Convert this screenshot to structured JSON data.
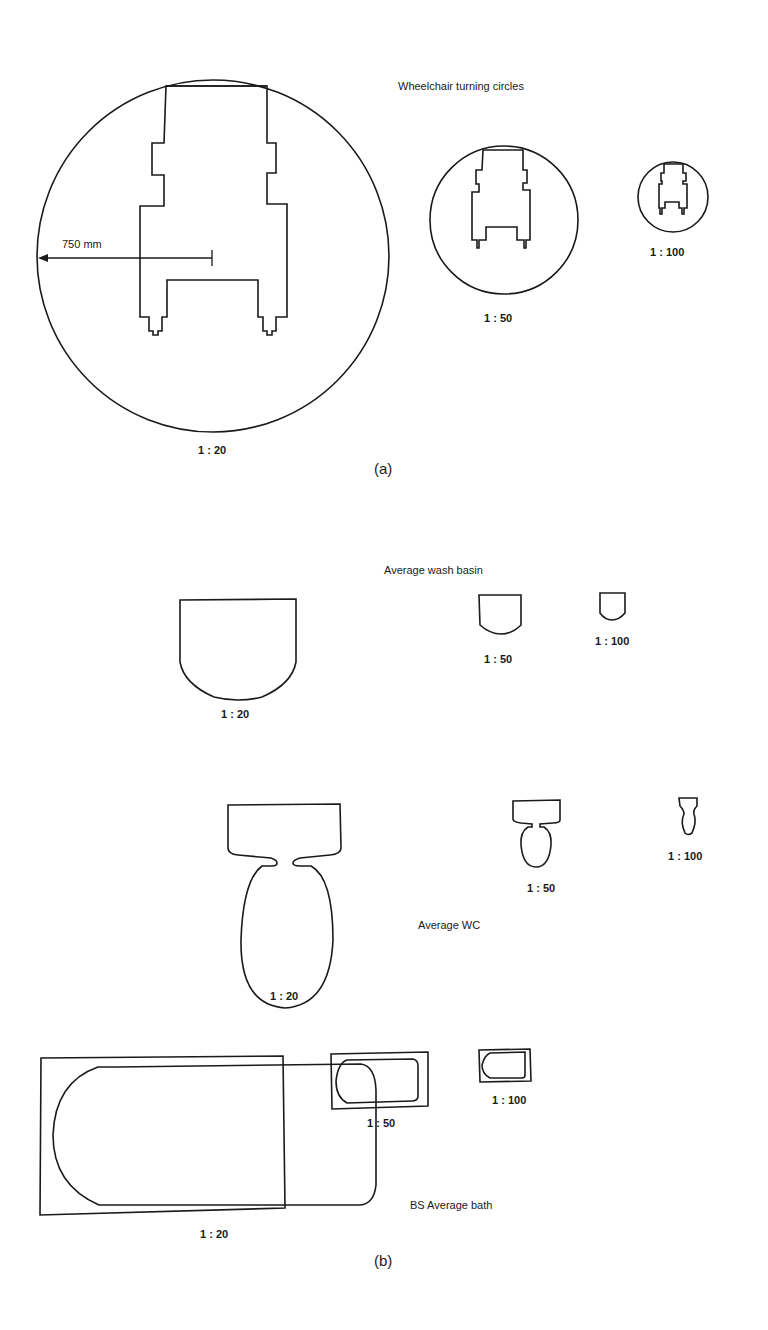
{
  "part_a": {
    "panel_label": "(a)",
    "title": "Wheelchair turning circles",
    "dimension_label": "750 mm",
    "scales": [
      "1 : 20",
      "1 : 50",
      "1 : 100"
    ]
  },
  "part_b": {
    "panel_label": "(b)",
    "wash_basin": {
      "title": "Average wash basin",
      "scales": [
        "1 : 20",
        "1 : 50",
        "1 : 100"
      ]
    },
    "wc": {
      "title": "Average WC",
      "scales": [
        "1 : 20",
        "1 : 50",
        "1 : 100"
      ]
    },
    "bath": {
      "title": "BS Average bath",
      "scales": [
        "1 : 20",
        "1 : 50",
        "1 : 100"
      ]
    }
  },
  "colors": {
    "ink": "#1a1a1a",
    "paper": "#ffffff"
  }
}
